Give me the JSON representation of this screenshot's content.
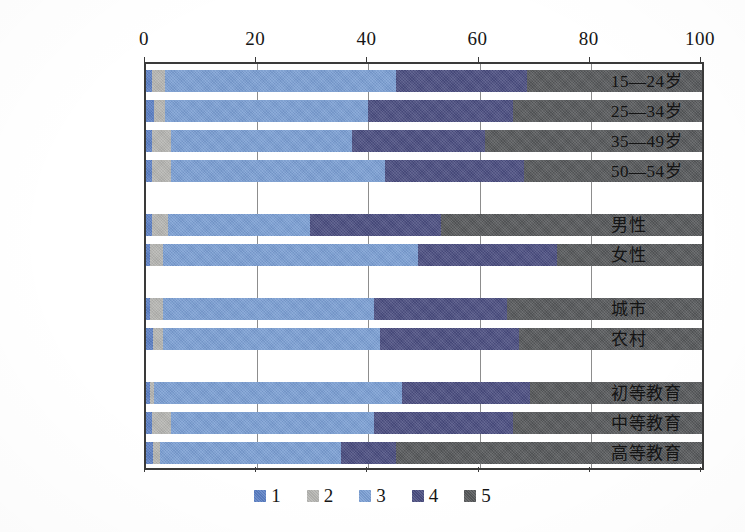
{
  "chart_data": {
    "type": "bar",
    "orientation": "horizontal",
    "stacked": true,
    "title": "",
    "subtitle": "",
    "xlabel": "",
    "ylabel": "",
    "xlim": [
      0,
      100
    ],
    "xticks": [
      0,
      20,
      40,
      60,
      80,
      100
    ],
    "xtick_labels": [
      "0",
      "20",
      "40",
      "60",
      "80",
      "100"
    ],
    "grid": true,
    "legend_position": "bottom",
    "categories": [
      "15—24岁",
      "25—34岁",
      "35—49岁",
      "50—54岁",
      "男性",
      "女性",
      "城市",
      "农村",
      "初等教育",
      "中等教育",
      "高等教育"
    ],
    "group_breaks_after": [
      3,
      5,
      7
    ],
    "series": [
      {
        "name": "1",
        "color": "#5B7FC4",
        "values": [
          1.0,
          1.5,
          1.0,
          1.0,
          1.0,
          0.8,
          0.8,
          1.2,
          0.8,
          1.0,
          1.2
        ]
      },
      {
        "name": "2",
        "color": "#B5B5B2",
        "values": [
          2.5,
          2.0,
          3.5,
          3.5,
          3.0,
          2.2,
          2.2,
          1.8,
          0.7,
          3.5,
          1.3
        ]
      },
      {
        "name": "3",
        "color": "#7B9FD4",
        "values": [
          41.5,
          36.5,
          32.5,
          38.5,
          25.5,
          46.0,
          38.0,
          39.0,
          44.5,
          36.5,
          32.5
        ]
      },
      {
        "name": "4",
        "color": "#4A4D80",
        "values": [
          23.5,
          26.0,
          24.0,
          25.0,
          23.5,
          25.0,
          24.0,
          25.0,
          23.0,
          25.0,
          10.0
        ]
      },
      {
        "name": "5",
        "color": "#56585A",
        "values": [
          31.5,
          34.0,
          39.0,
          32.0,
          47.0,
          26.0,
          35.0,
          33.0,
          31.0,
          34.0,
          55.0
        ]
      }
    ],
    "cumulative_boundaries": {
      "15—24岁": [
        1.0,
        3.5,
        45.0,
        68.5,
        100
      ],
      "25—34岁": [
        1.5,
        3.5,
        40.0,
        66.0,
        100
      ],
      "35—49岁": [
        1.0,
        4.5,
        37.0,
        61.0,
        100
      ],
      "50—54岁": [
        1.0,
        4.5,
        43.0,
        68.0,
        100
      ],
      "男性": [
        1.0,
        4.0,
        29.5,
        53.0,
        100
      ],
      "女性": [
        0.8,
        3.0,
        49.0,
        74.0,
        100
      ],
      "城市": [
        0.8,
        3.0,
        41.0,
        65.0,
        100
      ],
      "农村": [
        1.2,
        3.0,
        42.0,
        67.0,
        100
      ],
      "初等教育": [
        0.8,
        1.5,
        46.0,
        69.0,
        100
      ],
      "中等教育": [
        1.0,
        4.5,
        41.0,
        66.0,
        100
      ],
      "高等教育": [
        1.2,
        2.5,
        35.0,
        45.0,
        100
      ]
    },
    "legend": [
      {
        "label": "1",
        "color": "#5B7FC4"
      },
      {
        "label": "2",
        "color": "#B5B5B2"
      },
      {
        "label": "3",
        "color": "#7B9FD4"
      },
      {
        "label": "4",
        "color": "#4A4D80"
      },
      {
        "label": "5",
        "color": "#56585A"
      }
    ]
  },
  "axis": {
    "frame_color": "#3a3a3a",
    "gridline_color": "#8d8d8d"
  }
}
